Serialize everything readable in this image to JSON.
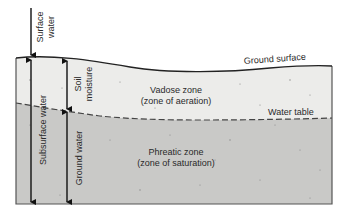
{
  "diagram": {
    "type": "cross-section",
    "colors": {
      "vadose_fill": "#ececea",
      "phreatic_fill": "#c9c9c7",
      "outline": "#222222",
      "text": "#2a2a2a"
    },
    "labels": {
      "surface_water_line1": "Surface",
      "surface_water_line2": "water",
      "soil_moisture_line1": "Soil",
      "soil_moisture_line2": "moisture",
      "subsurface_water": "Subsurface water",
      "ground_water": "Ground water",
      "ground_surface": "Ground surface",
      "water_table": "Water table",
      "vadose_line1": "Vadose zone",
      "vadose_line2": "(zone of aeration)",
      "phreatic_line1": "Phreatic zone",
      "phreatic_line2": "(zone of saturation)"
    }
  }
}
